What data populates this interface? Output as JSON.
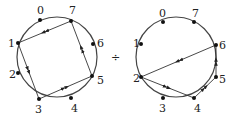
{
  "operator": "÷",
  "diagrams": [
    {
      "name": "left-cycle",
      "center": [
        57,
        57
      ],
      "radius": 40,
      "nodes": [
        {
          "label": "0",
          "pos": [
            40,
            20
          ],
          "lpos": [
            37,
            14
          ]
        },
        {
          "label": "7",
          "pos": [
            71,
            21
          ],
          "lpos": [
            69,
            14
          ]
        },
        {
          "label": "6",
          "pos": [
            93,
            44
          ],
          "lpos": [
            97,
            47
          ]
        },
        {
          "label": "5",
          "pos": [
            92,
            76
          ],
          "lpos": [
            97,
            84
          ]
        },
        {
          "label": "4",
          "pos": [
            71,
            98
          ],
          "lpos": [
            71,
            112
          ]
        },
        {
          "label": "3",
          "pos": [
            39,
            99
          ],
          "lpos": [
            35,
            113
          ]
        },
        {
          "label": "2",
          "pos": [
            18,
            73
          ],
          "lpos": [
            9,
            78
          ]
        },
        {
          "label": "1",
          "pos": [
            18,
            43
          ],
          "lpos": [
            8,
            47
          ]
        }
      ],
      "edges": [
        [
          "7",
          "1"
        ],
        [
          "1",
          "3"
        ],
        [
          "3",
          "5"
        ],
        [
          "5",
          "7"
        ]
      ]
    },
    {
      "name": "right-cycle",
      "center": [
        176,
        57
      ],
      "radius": 40,
      "nodes": [
        {
          "label": "0",
          "pos": [
            163,
            22
          ],
          "lpos": [
            159,
            17
          ]
        },
        {
          "label": "7",
          "pos": [
            194,
            22
          ],
          "lpos": [
            192,
            17
          ]
        },
        {
          "label": "6",
          "pos": [
            216,
            45
          ],
          "lpos": [
            219,
            49
          ]
        },
        {
          "label": "5",
          "pos": [
            216,
            77
          ],
          "lpos": [
            219,
            83
          ]
        },
        {
          "label": "4",
          "pos": [
            194,
            98
          ],
          "lpos": [
            194,
            112
          ]
        },
        {
          "label": "3",
          "pos": [
            163,
            98
          ],
          "lpos": [
            159,
            112
          ]
        },
        {
          "label": "2",
          "pos": [
            141,
            77
          ],
          "lpos": [
            133,
            82
          ]
        },
        {
          "label": "1",
          "pos": [
            141,
            44
          ],
          "lpos": [
            133,
            47
          ]
        }
      ],
      "edges": [
        [
          "6",
          "2"
        ],
        [
          "2",
          "4"
        ],
        [
          "4",
          "5"
        ],
        [
          "5",
          "6"
        ]
      ]
    }
  ]
}
